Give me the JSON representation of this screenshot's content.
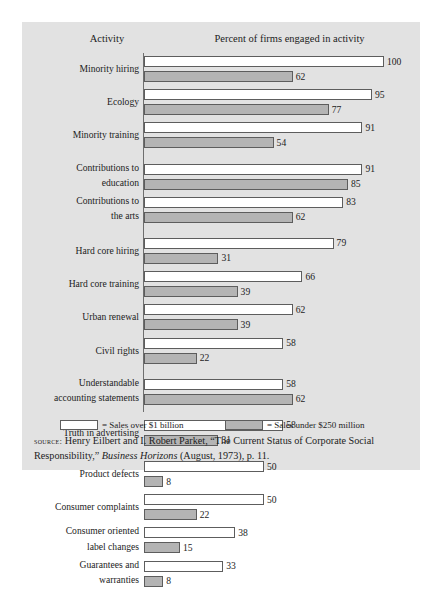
{
  "running_head": "",
  "exhibit": {
    "headers": {
      "activity": "Activity",
      "percent": "Percent of firms engaged in activity"
    },
    "legend": {
      "large_label": "= Sales over $1 billion",
      "small_label": "= Sales under $250 million"
    },
    "source": {
      "label": "source:",
      "text_1": "Henry Eilbert and I. Robert Parket, “The Current Status of Corporate Social Responsibility,” ",
      "journal": "Business Horizons",
      "text_2": " (August, 1973), p. 11."
    }
  },
  "chart_data": {
    "type": "bar",
    "title": "Percent of firms engaged in activity",
    "xlabel": "Percent of firms engaged in activity",
    "ylabel": "Activity",
    "xlim": [
      0,
      100
    ],
    "grid": false,
    "orientation": "horizontal",
    "legend_position": "bottom",
    "categories": [
      "Minority hiring",
      "Ecology",
      "Minority training",
      "Contributions to education",
      "Contributions to the arts",
      "Hard core hiring",
      "Hard core training",
      "Urban renewal",
      "Civil rights",
      "Understandable accounting statements",
      "Truth in advertising",
      "Product defects",
      "Consumer complaints",
      "Consumer oriented label changes",
      "Guarantees and warranties"
    ],
    "category_lines": [
      [
        "Minority hiring"
      ],
      [
        "Ecology"
      ],
      [
        "Minority training"
      ],
      [
        "Contributions to",
        "education"
      ],
      [
        "Contributions to",
        "the arts"
      ],
      [
        "Hard core hiring"
      ],
      [
        "Hard core training"
      ],
      [
        "Urban renewal"
      ],
      [
        "Civil rights"
      ],
      [
        "Understandable",
        "accounting statements"
      ],
      [
        "Truth in advertising"
      ],
      [
        "Product defects"
      ],
      [
        "Consumer complaints"
      ],
      [
        "Consumer oriented",
        "label changes"
      ],
      [
        "Guarantees and",
        "warranties"
      ]
    ],
    "series": [
      {
        "name": "Sales over $1 billion",
        "color": "#ffffff",
        "values": [
          100,
          95,
          91,
          91,
          83,
          79,
          66,
          62,
          58,
          58,
          58,
          50,
          50,
          38,
          33
        ]
      },
      {
        "name": "Sales under $250 million",
        "color": "#b4b4b4",
        "values": [
          62,
          77,
          54,
          85,
          62,
          31,
          39,
          39,
          22,
          62,
          31,
          8,
          22,
          15,
          8
        ]
      }
    ],
    "group_breaks_after": [
      2,
      4,
      8,
      9,
      10
    ]
  }
}
